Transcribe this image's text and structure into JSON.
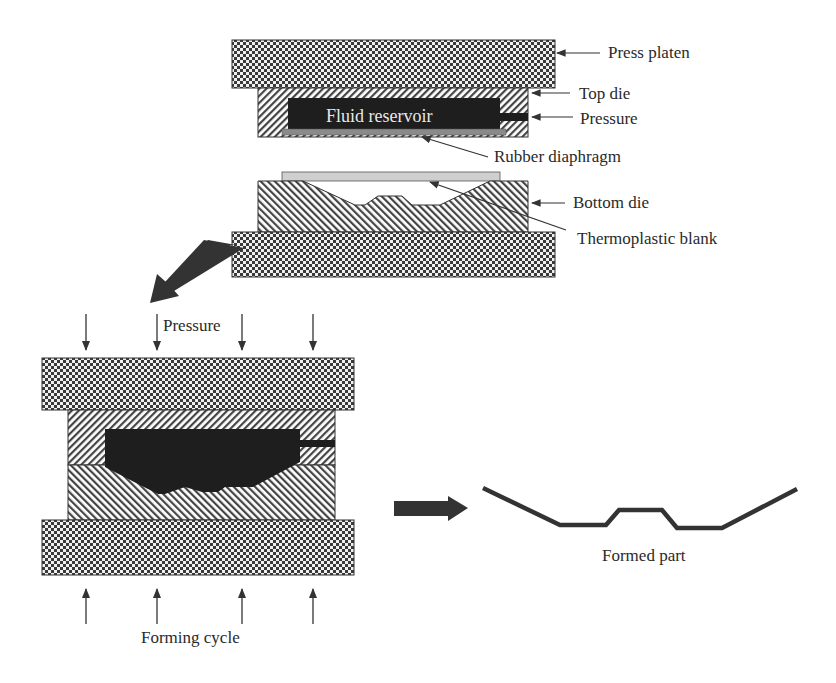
{
  "figure": {
    "top_diagram": {
      "title": "Initial setup",
      "labels": {
        "press_platen": "Press platen",
        "top_die": "Top die",
        "pressure": "Pressure",
        "fluid_reservoir": "Fluid reservoir",
        "rubber_diaphragm": "Rubber diaphragm",
        "bottom_die": "Bottom die",
        "thermoplastic_blank": "Thermoplastic blank"
      }
    },
    "bottom_diagram": {
      "labels": {
        "pressure": "Pressure",
        "forming_cycle": "Forming cycle"
      },
      "down_arrow_count": 4,
      "up_arrow_count": 4
    },
    "result": {
      "labels": {
        "formed_part": "Formed part"
      }
    },
    "caption_partial": ""
  },
  "colors": {
    "platen_dark": "#3a3a3a",
    "platen_light": "#f2f2f2",
    "hatch_line": "#444444",
    "fluid": "#1e1e1e",
    "diaphragm": "#8a8a8a",
    "blank": "#cfcfcf",
    "arrow_fill": "#333333",
    "text": "#2a2a2a"
  }
}
